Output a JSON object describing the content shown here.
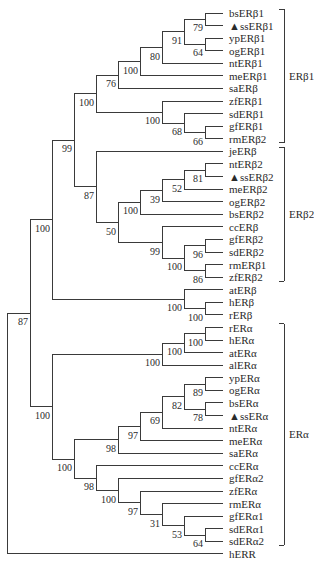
{
  "figure": {
    "type": "phylogenetic-tree",
    "leaf_spacing": 12.58,
    "leaf_top": 13,
    "leaf_x_end": 223,
    "marker": "▲",
    "leaves": [
      {
        "label": "bsERβ1",
        "marked": false
      },
      {
        "label": "ssERβ1",
        "marked": true
      },
      {
        "label": "ypERβ1",
        "marked": false
      },
      {
        "label": "ogERβ1",
        "marked": false
      },
      {
        "label": "ntERβ1",
        "marked": false
      },
      {
        "label": "meERβ1",
        "marked": false
      },
      {
        "label": "saERβ",
        "marked": false
      },
      {
        "label": "zfERβ1",
        "marked": false
      },
      {
        "label": "sdERβ1",
        "marked": false
      },
      {
        "label": "gfERβ1",
        "marked": false
      },
      {
        "label": "rmERβ2",
        "marked": false
      },
      {
        "label": "jeERβ",
        "marked": false
      },
      {
        "label": "ntERβ2",
        "marked": false
      },
      {
        "label": "ssERβ2",
        "marked": true
      },
      {
        "label": "meERβ2",
        "marked": false
      },
      {
        "label": "ogERβ2",
        "marked": false
      },
      {
        "label": "bsERβ2",
        "marked": false
      },
      {
        "label": "ccERβ",
        "marked": false
      },
      {
        "label": "gfERβ2",
        "marked": false
      },
      {
        "label": "sdERβ2",
        "marked": false
      },
      {
        "label": "rmERβ1",
        "marked": false
      },
      {
        "label": "zfERβ2",
        "marked": false
      },
      {
        "label": "atERβ",
        "marked": false
      },
      {
        "label": "hERβ",
        "marked": false
      },
      {
        "label": "rERβ",
        "marked": false
      },
      {
        "label": "rERα",
        "marked": false
      },
      {
        "label": "hERα",
        "marked": false
      },
      {
        "label": "atERα",
        "marked": false
      },
      {
        "label": "alERα",
        "marked": false
      },
      {
        "label": "ypERα",
        "marked": false
      },
      {
        "label": "ogERα",
        "marked": false
      },
      {
        "label": "bsERα",
        "marked": false
      },
      {
        "label": "ssERα",
        "marked": true
      },
      {
        "label": "ntERα",
        "marked": false
      },
      {
        "label": "meERα",
        "marked": false
      },
      {
        "label": "saERα",
        "marked": false
      },
      {
        "label": "ccERα",
        "marked": false
      },
      {
        "label": "gfERα2",
        "marked": false
      },
      {
        "label": "zfERα",
        "marked": false
      },
      {
        "label": "rmERα",
        "marked": false
      },
      {
        "label": "gfERα1",
        "marked": false
      },
      {
        "label": "sdERα1",
        "marked": false
      },
      {
        "label": "sdERα2",
        "marked": false
      },
      {
        "label": "hERR",
        "marked": false
      }
    ],
    "nodes": [
      {
        "id": "n_bs_ss",
        "x": 205,
        "children": [
          "L0",
          "L1"
        ],
        "bootstrap": "79"
      },
      {
        "id": "n_yp_og",
        "x": 205,
        "children": [
          "L2",
          "L3"
        ],
        "bootstrap": "64"
      },
      {
        "id": "n_b1a",
        "x": 184,
        "children": [
          "n_bs_ss",
          "n_yp_og"
        ],
        "bootstrap": "91"
      },
      {
        "id": "n_b1b",
        "x": 162,
        "children": [
          "n_b1a",
          "L4"
        ],
        "bootstrap": "80"
      },
      {
        "id": "n_b1c",
        "x": 140,
        "children": [
          "n_b1b",
          "L5"
        ],
        "bootstrap": "100"
      },
      {
        "id": "n_b1d",
        "x": 118,
        "children": [
          "n_b1c",
          "L6"
        ],
        "bootstrap": "76"
      },
      {
        "id": "n_gf_rm",
        "x": 205,
        "children": [
          "L9",
          "L10"
        ],
        "bootstrap": "66"
      },
      {
        "id": "n_sd",
        "x": 184,
        "children": [
          "L8",
          "n_gf_rm"
        ],
        "bootstrap": "68"
      },
      {
        "id": "n_zf",
        "x": 162,
        "children": [
          "L7",
          "n_sd"
        ],
        "bootstrap": "100"
      },
      {
        "id": "n_b1",
        "x": 96,
        "children": [
          "n_b1d",
          "n_zf"
        ],
        "bootstrap": "100"
      },
      {
        "id": "n_nt_ss2",
        "x": 205,
        "children": [
          "L12",
          "L13"
        ],
        "bootstrap": "81"
      },
      {
        "id": "n_me2",
        "x": 184,
        "children": [
          "n_nt_ss2",
          "L14"
        ],
        "bootstrap": "52"
      },
      {
        "id": "n_og2",
        "x": 162,
        "children": [
          "n_me2",
          "L15"
        ],
        "bootstrap": "39"
      },
      {
        "id": "n_bs2",
        "x": 140,
        "children": [
          "n_og2",
          "L16"
        ],
        "bootstrap": "100"
      },
      {
        "id": "n_gf_sd2",
        "x": 205,
        "children": [
          "L18",
          "L19"
        ],
        "bootstrap": "96"
      },
      {
        "id": "n_rm_zf2",
        "x": 205,
        "children": [
          "L20",
          "L21"
        ],
        "bootstrap": "86"
      },
      {
        "id": "n_b2a",
        "x": 184,
        "children": [
          "n_gf_sd2",
          "n_rm_zf2"
        ],
        "bootstrap": "100"
      },
      {
        "id": "n_cc",
        "x": 162,
        "children": [
          "L17",
          "n_b2a"
        ],
        "bootstrap": "99"
      },
      {
        "id": "n_b2b",
        "x": 118,
        "children": [
          "n_bs2",
          "n_cc"
        ],
        "bootstrap": "50"
      },
      {
        "id": "n_b2",
        "x": 96,
        "children": [
          "L11",
          "n_b2b"
        ],
        "bootstrap": "87"
      },
      {
        "id": "n_fishb",
        "x": 74,
        "children": [
          "n_b1",
          "n_b2"
        ],
        "bootstrap": "99"
      },
      {
        "id": "n_h_r_b",
        "x": 205,
        "children": [
          "L23",
          "L24"
        ],
        "bootstrap": "100"
      },
      {
        "id": "n_tetb",
        "x": 184,
        "children": [
          "L22",
          "n_h_r_b"
        ],
        "bootstrap": "100"
      },
      {
        "id": "n_beta",
        "x": 52,
        "children": [
          "n_fishb",
          "n_tetb"
        ],
        "bootstrap": "100"
      },
      {
        "id": "n_r_h_a",
        "x": 205,
        "children": [
          "L25",
          "L26"
        ],
        "bootstrap": "100"
      },
      {
        "id": "n_at_a",
        "x": 184,
        "children": [
          "n_r_h_a",
          "L27"
        ],
        "bootstrap": "100"
      },
      {
        "id": "n_tet_a",
        "x": 162,
        "children": [
          "n_at_a",
          "L28"
        ],
        "bootstrap": "100"
      },
      {
        "id": "n_yp_og_a",
        "x": 205,
        "children": [
          "L29",
          "L30"
        ],
        "bootstrap": "89"
      },
      {
        "id": "n_bs_ss_a",
        "x": 205,
        "children": [
          "L31",
          "L32"
        ],
        "bootstrap": "78"
      },
      {
        "id": "n_a1",
        "x": 184,
        "children": [
          "n_yp_og_a",
          "n_bs_ss_a"
        ],
        "bootstrap": "82"
      },
      {
        "id": "n_a2",
        "x": 162,
        "children": [
          "n_a1",
          "L33"
        ],
        "bootstrap": "69"
      },
      {
        "id": "n_a3",
        "x": 140,
        "children": [
          "n_a2",
          "L34"
        ],
        "bootstrap": "97"
      },
      {
        "id": "n_a4",
        "x": 118,
        "children": [
          "n_a3",
          "L35"
        ],
        "bootstrap": "98"
      },
      {
        "id": "n_sd_a",
        "x": 205,
        "children": [
          "L41",
          "L42"
        ],
        "bootstrap": "64"
      },
      {
        "id": "n_gf1_a",
        "x": 184,
        "children": [
          "L40",
          "n_sd_a"
        ],
        "bootstrap": "53"
      },
      {
        "id": "n_rm_a",
        "x": 162,
        "children": [
          "L39",
          "n_gf1_a"
        ],
        "bootstrap": "31"
      },
      {
        "id": "n_zf_a",
        "x": 140,
        "children": [
          "L38",
          "n_rm_a"
        ],
        "bootstrap": "97"
      },
      {
        "id": "n_gf2_a",
        "x": 118,
        "children": [
          "L37",
          "n_zf_a"
        ],
        "bootstrap": "100"
      },
      {
        "id": "n_cc_a",
        "x": 96,
        "children": [
          "L36",
          "n_gf2_a"
        ],
        "bootstrap": "98"
      },
      {
        "id": "n_fisha",
        "x": 74,
        "children": [
          "n_a4",
          "n_cc_a"
        ],
        "bootstrap": "100"
      },
      {
        "id": "n_alpha",
        "x": 52,
        "children": [
          "n_tet_a",
          "n_fisha"
        ],
        "bootstrap": "100"
      },
      {
        "id": "n_er",
        "x": 30,
        "children": [
          "n_beta",
          "n_alpha"
        ],
        "bootstrap": "87"
      },
      {
        "id": "n_root",
        "x": 7,
        "children": [
          "n_er",
          "L43"
        ],
        "bootstrap": ""
      }
    ],
    "clades": [
      {
        "label": "ERβ1",
        "from": 0,
        "to": 10
      },
      {
        "label": "ERβ2",
        "from": 11,
        "to": 21
      },
      {
        "label": "ERα",
        "from": 25,
        "to": 42
      }
    ],
    "colors": {
      "line": "#3a3a3a",
      "text": "#2a2a2a",
      "background": "#ffffff"
    }
  }
}
